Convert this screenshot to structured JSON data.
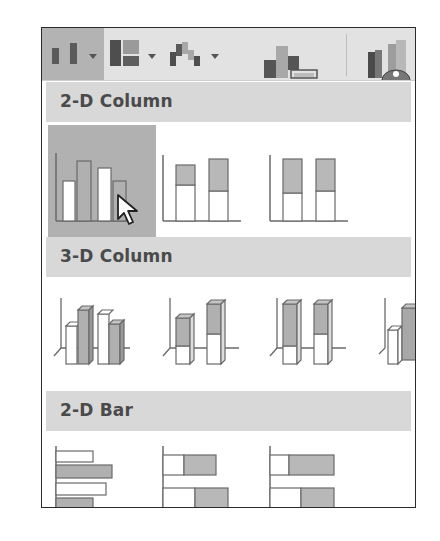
{
  "toolbar": {
    "buttons": [
      {
        "name": "insert-column-or-bar-chart",
        "icon": "column-chart-icon",
        "has_dropdown": true,
        "active": true
      },
      {
        "name": "insert-hierarchy-chart",
        "icon": "treemap-icon",
        "has_dropdown": true,
        "active": false
      },
      {
        "name": "insert-waterfall-chart",
        "icon": "waterfall-icon",
        "has_dropdown": true,
        "active": false
      },
      {
        "name": "recommended-charts",
        "icon": "recommended-charts-icon",
        "has_dropdown": false,
        "active": false
      },
      {
        "name": "3d-map",
        "icon": "3d-map-icon",
        "has_dropdown": false,
        "active": false
      }
    ]
  },
  "sections": [
    {
      "title": "2-D Column",
      "items": [
        {
          "name": "clustered-column",
          "selected": true
        },
        {
          "name": "stacked-column",
          "selected": false
        },
        {
          "name": "100-percent-stacked-column",
          "selected": false
        }
      ]
    },
    {
      "title": "3-D Column",
      "items": [
        {
          "name": "3d-clustered-column",
          "selected": false
        },
        {
          "name": "3d-stacked-column",
          "selected": false
        },
        {
          "name": "3d-100-percent-stacked-column",
          "selected": false
        },
        {
          "name": "3d-column",
          "selected": false
        }
      ]
    },
    {
      "title": "2-D Bar",
      "items": [
        {
          "name": "clustered-bar",
          "selected": false
        },
        {
          "name": "stacked-bar",
          "selected": false
        },
        {
          "name": "100-percent-stacked-bar",
          "selected": false
        }
      ]
    }
  ],
  "colors": {
    "toolbar_bg": "#e2e2e2",
    "active_bg": "#b3b3b3",
    "section_bg": "#d8d8d8",
    "bar_fill": "#b8b8b8",
    "bar_stroke": "#6a6a6a",
    "white_fill": "#ffffff"
  }
}
